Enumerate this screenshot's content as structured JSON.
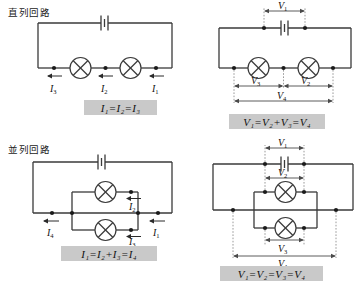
{
  "figure": {
    "kind": "circuit-diagram-set",
    "panels": [
      {
        "id": "series-current",
        "title": "直列回路",
        "circuit": "series",
        "quantity": "current",
        "components": [
          "battery",
          "lamp",
          "lamp"
        ],
        "labels": [
          "I1",
          "I2",
          "I3"
        ],
        "label_text": [
          "I",
          "I",
          "I"
        ],
        "label_sub": [
          "1",
          "2",
          "3"
        ],
        "formula": "I1 = I2 = I3"
      },
      {
        "id": "series-voltage",
        "title": "",
        "circuit": "series",
        "quantity": "voltage",
        "components": [
          "battery",
          "lamp",
          "lamp"
        ],
        "labels": [
          "V1",
          "V2",
          "V3",
          "V4"
        ],
        "formula": "V1 = V2 + V3 = V4"
      },
      {
        "id": "parallel-current",
        "title": "並列回路",
        "circuit": "parallel",
        "quantity": "current",
        "components": [
          "battery",
          "lamp",
          "lamp"
        ],
        "labels": [
          "I1",
          "I2",
          "I3",
          "I4"
        ],
        "formula": "I1 = I2 + I3 = I4"
      },
      {
        "id": "parallel-voltage",
        "title": "",
        "circuit": "parallel",
        "quantity": "voltage",
        "components": [
          "battery",
          "lamp",
          "lamp"
        ],
        "labels": [
          "V1",
          "V2",
          "V3",
          "V4"
        ],
        "formula": "V1 = V2 = V3 = V4"
      }
    ]
  },
  "titles": {
    "series": "直列回路",
    "parallel": "並列回路"
  },
  "formulas": {
    "series_current": "I₁=I₂=I₃",
    "series_voltage": "V₁=V₂+V₃=V₄",
    "parallel_current": "I₁=I₂+I₃=I₄",
    "parallel_voltage": "V₁=V₂=V₃=V₄"
  },
  "symbols": {
    "current": "I",
    "voltage": "V",
    "sub1": "1",
    "sub2": "2",
    "sub3": "3",
    "sub4": "4"
  },
  "colors": {
    "wire": "#3a3a3a",
    "node": "#1a1a1a",
    "guide": "#9a9a9a",
    "formula_background": "#c9c9c9",
    "text": "#111111",
    "page_background": "#ffffff"
  }
}
